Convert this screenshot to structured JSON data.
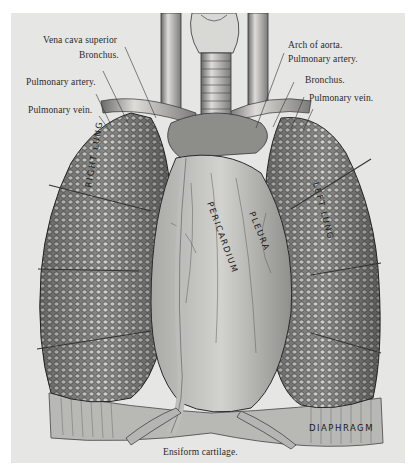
{
  "figure": {
    "type": "anatomical engraving",
    "background_color": "#e6e6e4",
    "ink_color": "#2a2a2a"
  },
  "labels_left": [
    {
      "id": "vena-cava-superior",
      "text": "Vena cava superior"
    },
    {
      "id": "bronchus-right",
      "text": "Bronchus."
    },
    {
      "id": "pulmonary-artery-right",
      "text": "Pulmonary artery."
    },
    {
      "id": "pulmonary-vein-right",
      "text": "Pulmonary vein."
    }
  ],
  "labels_right": [
    {
      "id": "arch-of-aorta",
      "text": "Arch of aorta."
    },
    {
      "id": "pulmonary-artery-left",
      "text": "Pulmonary artery."
    },
    {
      "id": "bronchus-left",
      "text": "Bronchus."
    },
    {
      "id": "pulmonary-vein-left",
      "text": "Pulmonary vein."
    }
  ],
  "label_bottom": {
    "id": "ensiform-cartilage",
    "text": "Ensiform cartilage."
  },
  "organ_inscriptions": {
    "right_lung": "RIGHT LUNG",
    "left_lung": "LEFT LUNG",
    "pericardium": "PERICARDIUM",
    "pleura": "PLEURA",
    "diaphragm": "DIAPHRAGM"
  }
}
